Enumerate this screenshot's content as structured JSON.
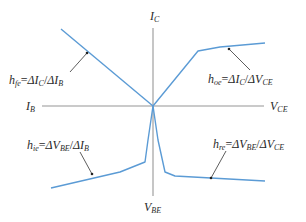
{
  "diagram": {
    "colors": {
      "curve": "#5b9bd5",
      "axis": "#b8b8b8",
      "text": "#2a2a2a"
    },
    "axes": {
      "top": {
        "label": "I",
        "sub": "C"
      },
      "bottom": {
        "label": "V",
        "sub": "BE"
      },
      "left": {
        "label": "I",
        "sub": "B"
      },
      "right": {
        "label": "V",
        "sub": "CE"
      }
    },
    "params": [
      {
        "id": "hfe",
        "h_sub": "fe",
        "num": "ΔI",
        "num_sub": "C",
        "den": "ΔI",
        "den_sub": "B",
        "quadrant": "upper-left"
      },
      {
        "id": "hoe",
        "h_sub": "oe",
        "num": "ΔI",
        "num_sub": "C",
        "den": "ΔV",
        "den_sub": "CE",
        "quadrant": "upper-right"
      },
      {
        "id": "hie",
        "h_sub": "ie",
        "num": "ΔV",
        "num_sub": "BE",
        "den": "ΔI",
        "den_sub": "B",
        "quadrant": "lower-left"
      },
      {
        "id": "hre",
        "h_sub": "re",
        "num": "ΔV",
        "num_sub": "BE",
        "den": "ΔV",
        "den_sub": "CE",
        "quadrant": "lower-right"
      }
    ],
    "eq": "=",
    "slash": "/",
    "h": "h"
  }
}
